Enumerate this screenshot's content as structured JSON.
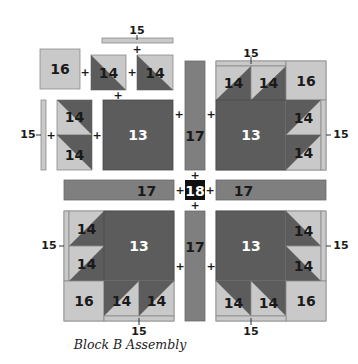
{
  "caption": "Block B Assembly",
  "colors": {
    "light": "#c9c9c9",
    "dark": "#5c5c5c",
    "medium": "#7f7f7f",
    "center": "#111111",
    "stroke": "#8a8a8a"
  },
  "pieces": {
    "p13": "13",
    "p14": "14",
    "p15": "15",
    "p16": "16",
    "p17": "17",
    "p18": "18"
  },
  "symbols": {
    "plus": "+"
  }
}
